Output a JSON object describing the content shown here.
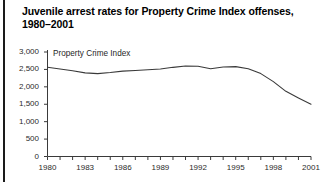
{
  "figure": {
    "title_line1": "Juvenile arrest rates for Property Crime Index offenses,",
    "title_line2": "1980–2001"
  },
  "chart_data": {
    "type": "line",
    "title": "Juvenile arrest rates for Property Crime Index offenses, 1980–2001",
    "xlabel": "",
    "ylabel": "",
    "xlim": [
      1980,
      2001
    ],
    "ylim": [
      0,
      3000
    ],
    "grid": false,
    "legend_position": "inline-above-line",
    "annotations": [
      "Property Crime Index"
    ],
    "ytick_labels": [
      "0",
      "500",
      "1,000",
      "1,500",
      "2,000",
      "2,500",
      "3,000"
    ],
    "ytick_values": [
      0,
      500,
      1000,
      1500,
      2000,
      2500,
      3000
    ],
    "xtick_labels": [
      "1980",
      "1983",
      "1986",
      "1989",
      "1992",
      "1995",
      "1998",
      "2001"
    ],
    "xtick_values": [
      1980,
      1983,
      1986,
      1989,
      1992,
      1995,
      1998,
      2001
    ],
    "xminor_ticks": [
      1980,
      1981,
      1982,
      1983,
      1984,
      1985,
      1986,
      1987,
      1988,
      1989,
      1990,
      1991,
      1992,
      1993,
      1994,
      1995,
      1996,
      1997,
      1998,
      1999,
      2000,
      2001
    ],
    "series": [
      {
        "name": "Property Crime Index",
        "color": "#3a3a3a",
        "x": [
          1980,
          1981,
          1982,
          1983,
          1984,
          1985,
          1986,
          1987,
          1988,
          1989,
          1990,
          1991,
          1992,
          1993,
          1994,
          1995,
          1996,
          1997,
          1998,
          1999,
          2000,
          2001
        ],
        "values": [
          2560,
          2510,
          2460,
          2400,
          2380,
          2410,
          2450,
          2470,
          2490,
          2510,
          2560,
          2600,
          2590,
          2520,
          2570,
          2580,
          2520,
          2380,
          2150,
          1870,
          1680,
          1500
        ]
      }
    ]
  }
}
